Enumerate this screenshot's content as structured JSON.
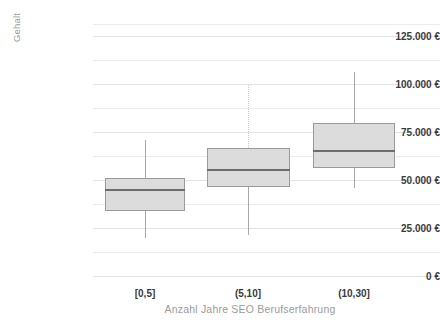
{
  "chart_data": {
    "type": "box",
    "title": "",
    "subtitle": "",
    "xlabel": "Anzahl Jahre SEO Berufserfahrung",
    "ylabel": "Gehalt",
    "categories": [
      "[0,5]",
      "(5,10]",
      "(10,30]"
    ],
    "ylim": [
      0,
      131250
    ],
    "yticks": [
      0,
      25000,
      50000,
      75000,
      100000,
      125000
    ],
    "ytick_labels": [
      "0 €",
      "25.000 €",
      "50.000 €",
      "75.000 €",
      "100.000 €",
      "125.000 €"
    ],
    "grid": "horizontal",
    "legend": "none",
    "currency": "EUR",
    "series": [
      {
        "name": "[0,5]",
        "whisker_low": 20000,
        "q1": 33850,
        "median": 44800,
        "q3": 51000,
        "whisker_high": 70800,
        "whisker_high_style": "solid"
      },
      {
        "name": "(5,10]",
        "whisker_low": 21350,
        "q1": 46350,
        "median": 55200,
        "q3": 66700,
        "whisker_high": 99500,
        "whisker_high_style": "dotted"
      },
      {
        "name": "(10,30]",
        "whisker_low": 45800,
        "q1": 56250,
        "median": 65100,
        "q3": 79700,
        "whisker_high": 106250,
        "whisker_high_style": "solid"
      }
    ],
    "colors": {
      "box_fill": "#dcdcdc",
      "box_stroke": "#9a9a9a",
      "median": "#6d6d6d",
      "whisker": "#a8a8a8",
      "grid": "#ececec",
      "tick_text": "#3a3a3a",
      "axis_title": "#9b9b9b",
      "background": "#ffffff"
    }
  },
  "axes": {
    "y_title": "Gehalt",
    "x_title": "Anzahl Jahre SEO Berufserfahrung"
  },
  "yticks": [
    {
      "value": 125000,
      "label": "125.000 €"
    },
    {
      "value": 100000,
      "label": "100.000 €"
    },
    {
      "value": 75000,
      "label": "75.000 €"
    },
    {
      "value": 50000,
      "label": "50.000 €"
    },
    {
      "value": 25000,
      "label": "25.000 €"
    },
    {
      "value": 0,
      "label": "0 €"
    }
  ],
  "xticks": [
    {
      "label": "[0,5]"
    },
    {
      "label": "(5,10]"
    },
    {
      "label": "(10,30]"
    }
  ]
}
